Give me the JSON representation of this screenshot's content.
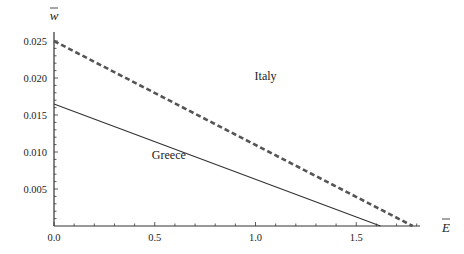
{
  "chart_data": {
    "type": "line",
    "title": "",
    "xlabel": "Ē",
    "ylabel": "w̄",
    "xlim": [
      0,
      1.82
    ],
    "ylim": [
      0,
      0.026
    ],
    "grid": false,
    "legend": "inline labels",
    "x_ticks": [
      "0.0",
      "0.5",
      "1.0",
      "1.5"
    ],
    "y_ticks": [
      "0.005",
      "0.010",
      "0.015",
      "0.020",
      "0.025"
    ],
    "series": [
      {
        "name": "Italy",
        "style": "dashed",
        "color": "#555555",
        "x": [
          0.0,
          1.78
        ],
        "y": [
          0.025,
          0.0
        ]
      },
      {
        "name": "Greece",
        "style": "solid",
        "color": "#333333",
        "x": [
          0.0,
          1.62
        ],
        "y": [
          0.0165,
          0.0
        ]
      }
    ],
    "annotations": [
      {
        "text": "Italy",
        "x": 1.05,
        "y": 0.0197
      },
      {
        "text": "Greece",
        "x": 0.57,
        "y": 0.009
      }
    ]
  }
}
